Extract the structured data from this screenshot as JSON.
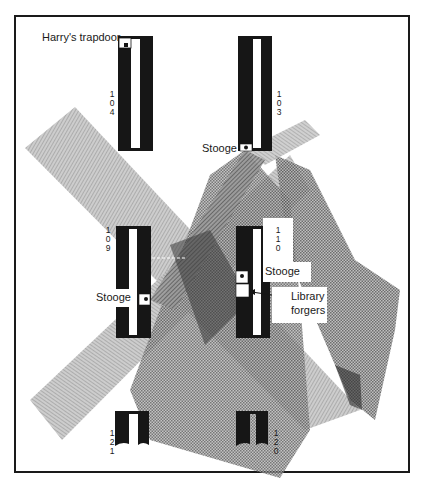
{
  "diagram": {
    "colors": {
      "frame": "#1a1a1a",
      "stack": "#161616",
      "aisle": "#ffffff",
      "cone_light": "#a9a9a9",
      "cone_mid": "#7e7e7e",
      "cone_dark": "#3c3c3c"
    },
    "stacks": [
      {
        "id": "104",
        "digits": [
          "1",
          "0",
          "4"
        ]
      },
      {
        "id": "103",
        "digits": [
          "1",
          "0",
          "3"
        ]
      },
      {
        "id": "109",
        "digits": [
          "1",
          "0",
          "9"
        ]
      },
      {
        "id": "110",
        "digits": [
          "1",
          "1",
          "0"
        ]
      },
      {
        "id": "121",
        "digits": [
          "1",
          "2",
          "1"
        ]
      },
      {
        "id": "120",
        "digits": [
          "1",
          "2",
          "0"
        ]
      }
    ],
    "labels": {
      "trapdoor": "Harry's trapdoor",
      "stooge_103": "Stooge",
      "stooge_109": "Stooge",
      "stooge_110": "Stooge",
      "forgers_line1": "Library",
      "forgers_line2": "forgers"
    }
  }
}
